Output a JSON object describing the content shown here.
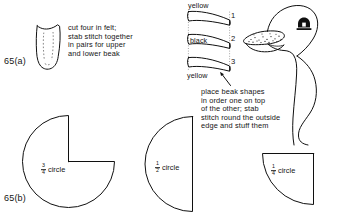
{
  "page": {
    "background": "#ffffff",
    "ink": "#101010",
    "width": 339,
    "height": 215
  },
  "figures": {
    "a": {
      "label": "65(a)",
      "piece_caption": "cut four in felt;\nstab stitch together\nin pairs for upper\nand lower beak",
      "piece_name": "beak gusset pattern piece"
    },
    "b": {
      "label": "65(b)",
      "circles": [
        {
          "name": "three-quarter-circle",
          "fraction_num": "3",
          "fraction_den": "4",
          "word": "circle"
        },
        {
          "name": "half-circle",
          "fraction_num": "1",
          "fraction_den": "2",
          "word": "circle"
        },
        {
          "name": "quarter-circle",
          "fraction_num": "1",
          "fraction_den": "4",
          "word": "circle"
        }
      ]
    }
  },
  "beak_stack": {
    "top_color_label": "yellow",
    "middle_color_label": "black",
    "bottom_color_label": "yellow",
    "numbers": [
      "1",
      "2",
      "3"
    ],
    "caption": "place beak shapes\nin order one on top\nof the other; stab\nstitch round the outside\nedge and stuff them"
  },
  "duck": {
    "name": "duck-head-illustration",
    "parts": [
      "head",
      "neck",
      "eye",
      "stippled-beak"
    ]
  }
}
